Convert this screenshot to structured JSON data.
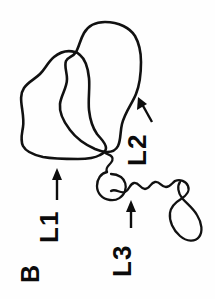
{
  "figure": {
    "panel_letter": "B",
    "background_color": "#fefefe",
    "ink_color": "#111111",
    "width_px": 215,
    "height_px": 299,
    "orientation_note": "rotated",
    "labels": [
      {
        "id": "L1",
        "text": "L1",
        "arrow": "up",
        "points_to": "large-left-loop"
      },
      {
        "id": "L2",
        "text": "L2",
        "arrow": "up-left",
        "points_to": "large-right-loop"
      },
      {
        "id": "L3",
        "text": "L3",
        "arrow": "up",
        "points_to": "supercoiled-tail"
      }
    ],
    "structures": [
      {
        "id": "loop-l1",
        "name": "large-left-loop",
        "kind": "closed-loop"
      },
      {
        "id": "loop-l2",
        "name": "large-right-loop",
        "kind": "closed-loop"
      },
      {
        "id": "tail-l3",
        "name": "supercoiled-tail",
        "kind": "coiled-strand"
      },
      {
        "id": "end-loop",
        "name": "terminal-figure-eight",
        "kind": "figure-eight"
      }
    ]
  }
}
